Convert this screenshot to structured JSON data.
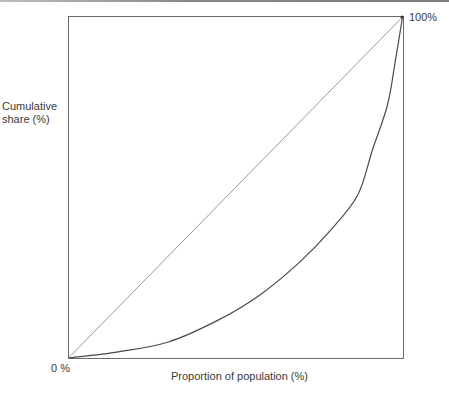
{
  "chart_data": {
    "type": "line",
    "title": "",
    "xlabel": "Proportion of population (%)",
    "ylabel": "Cumulative share (%)",
    "xlim": [
      0,
      100
    ],
    "ylim": [
      0,
      100
    ],
    "grid": false,
    "legend": null,
    "annotations": [
      {
        "text": "0 %",
        "position": "bottom-left origin"
      },
      {
        "text": "100%",
        "position": "top-right corner"
      }
    ],
    "series": [
      {
        "name": "Line of equality",
        "style": "thin light gray straight line",
        "x": [
          0,
          100
        ],
        "y": [
          0,
          100
        ]
      },
      {
        "name": "Lorenz curve",
        "style": "dark gray curve",
        "x": [
          0,
          14.9,
          29.9,
          44.8,
          57.3,
          69.3,
          78.5,
          86.6,
          91.0,
          95.5,
          97.9,
          100
        ],
        "y": [
          0,
          1.8,
          4.7,
          11.1,
          18.5,
          28.2,
          37.5,
          47.8,
          61.0,
          74.2,
          87.4,
          100
        ]
      }
    ]
  },
  "labels": {
    "ylabel_line1": "Cumulative",
    "ylabel_line2": "share (%)",
    "xlabel": "Proportion of population (%)",
    "origin": "0 %",
    "top_right": "100%"
  },
  "colors": {
    "frame": "#555555",
    "diagonal": "#9a9a9a",
    "curve": "#4a4a4a"
  }
}
